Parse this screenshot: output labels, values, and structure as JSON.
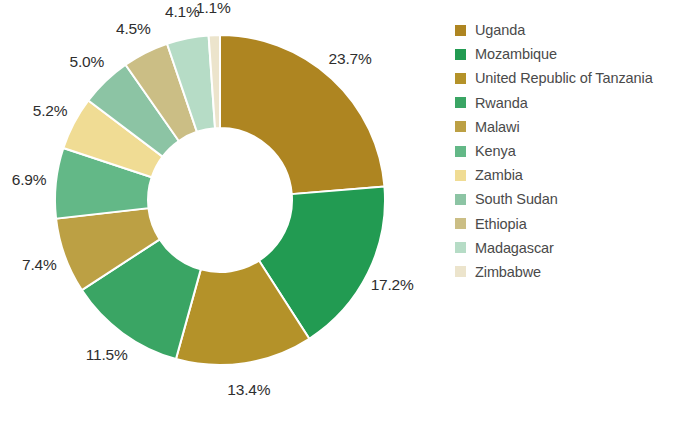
{
  "chart_data": {
    "type": "pie",
    "variant": "donut",
    "title": "",
    "subtitle": "",
    "xlabel": "",
    "ylabel": "",
    "grid": false,
    "legend_position": "right",
    "value_unit": "%",
    "categories": [
      "Uganda",
      "Mozambique",
      "United Republic of Tanzania",
      "Rwanda",
      "Malawi",
      "Kenya",
      "Zambia",
      "South Sudan",
      "Ethiopia",
      "Madagascar",
      "Zimbabwe"
    ],
    "values": [
      23.7,
      17.2,
      13.4,
      11.5,
      7.4,
      6.9,
      5.2,
      5.0,
      4.5,
      4.1,
      1.1
    ],
    "data_labels": [
      "23.7%",
      "17.2%",
      "13.4%",
      "11.5%",
      "7.4%",
      "6.9%",
      "5.2%",
      "5.0%",
      "4.5%",
      "4.1%",
      "1.1%"
    ],
    "colors": [
      "#ae8521",
      "#229b52",
      "#b49229",
      "#3aa564",
      "#bca044",
      "#63b887",
      "#f0dc94",
      "#8cc4a4",
      "#cbbe85",
      "#b6dcc6",
      "#ece4cc"
    ],
    "slices": [
      {
        "label": "Uganda",
        "value": 23.7,
        "display": "23.7%",
        "color": "#ae8521"
      },
      {
        "label": "Mozambique",
        "value": 17.2,
        "display": "17.2%",
        "color": "#229b52"
      },
      {
        "label": "United Republic of Tanzania",
        "value": 13.4,
        "display": "13.4%",
        "color": "#b49229"
      },
      {
        "label": "Rwanda",
        "value": 11.5,
        "display": "11.5%",
        "color": "#3aa564"
      },
      {
        "label": "Malawi",
        "value": 7.4,
        "display": "7.4%",
        "color": "#bca044"
      },
      {
        "label": "Kenya",
        "value": 6.9,
        "display": "6.9%",
        "color": "#63b887"
      },
      {
        "label": "Zambia",
        "value": 5.2,
        "display": "5.2%",
        "color": "#f0dc94"
      },
      {
        "label": "South Sudan",
        "value": 5.0,
        "display": "5.0%",
        "color": "#8cc4a4"
      },
      {
        "label": "Ethiopia",
        "value": 4.5,
        "display": "4.5%",
        "color": "#cbbe85"
      },
      {
        "label": "Madagascar",
        "value": 4.1,
        "display": "4.1%",
        "color": "#b6dcc6"
      },
      {
        "label": "Zimbabwe",
        "value": 1.1,
        "display": "1.1%",
        "color": "#ece4cc"
      }
    ]
  },
  "legend": {
    "items": [
      {
        "label": "Uganda",
        "color": "#ae8521"
      },
      {
        "label": "Mozambique",
        "color": "#229b52"
      },
      {
        "label": "United Republic of Tanzania",
        "color": "#b49229"
      },
      {
        "label": "Rwanda",
        "color": "#3aa564"
      },
      {
        "label": "Malawi",
        "color": "#bca044"
      },
      {
        "label": "Kenya",
        "color": "#63b887"
      },
      {
        "label": "Zambia",
        "color": "#f0dc94"
      },
      {
        "label": "South Sudan",
        "color": "#8cc4a4"
      },
      {
        "label": "Ethiopia",
        "color": "#cbbe85"
      },
      {
        "label": "Madagascar",
        "color": "#b6dcc6"
      },
      {
        "label": "Zimbabwe",
        "color": "#ece4cc"
      }
    ]
  },
  "style": {
    "background": "#ffffff",
    "label_color": "#2e2e2e",
    "legend_text_color": "#4a4a4a",
    "slice_gap_color": "#ffffff"
  },
  "geometry": {
    "center_x": 220,
    "center_y": 200,
    "outer_radius": 165,
    "inner_radius": 72,
    "start_angle_deg": -90,
    "label_radius": 192
  }
}
